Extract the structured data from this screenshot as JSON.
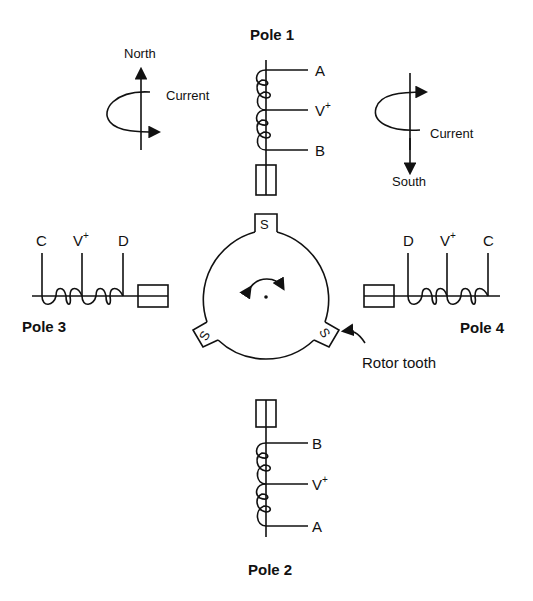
{
  "labels": {
    "pole1": "Pole 1",
    "pole2": "Pole 2",
    "pole3": "Pole 3",
    "pole4": "Pole 4",
    "north": "North",
    "south": "South",
    "current_left": "Current",
    "current_right": "Current",
    "rotor_tooth": "Rotor tooth"
  },
  "pole1_taps": [
    "A",
    "V",
    "B"
  ],
  "pole2_taps": [
    "B",
    "V",
    "A"
  ],
  "pole3_taps": [
    "C",
    "V",
    "D"
  ],
  "pole4_taps": [
    "D",
    "V",
    "C"
  ],
  "vplus_superscript": "+",
  "rotor_teeth": [
    "S",
    "S",
    "S"
  ]
}
